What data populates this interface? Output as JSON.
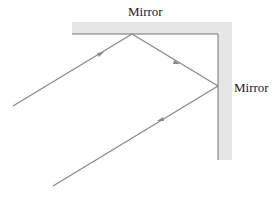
{
  "labels": {
    "top_mirror": "Mirror",
    "side_mirror": "Mirror"
  },
  "colors": {
    "mirror_fill": "#e6e6e6",
    "mirror_edge": "#777777",
    "ray": "#8a8a8a"
  }
}
